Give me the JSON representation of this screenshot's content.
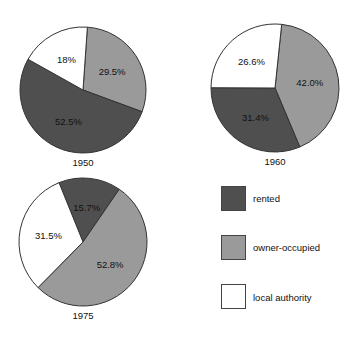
{
  "chart_data": {
    "type": "pie",
    "title": "",
    "categories": [
      "rented",
      "owner-occupied",
      "local authority"
    ],
    "colors": {
      "rented": "#4f4f4f",
      "owner-occupied": "#9a9a9a",
      "local authority": "#ffffff"
    },
    "pies": [
      {
        "label": "1950",
        "cx": 83,
        "cy": 90,
        "r": 63,
        "start_angle": 4,
        "order": [
          "owner-occupied",
          "rented",
          "local authority"
        ],
        "values": {
          "rented": 52.5,
          "owner-occupied": 29.5,
          "local authority": 18
        },
        "value_labels": {
          "rented": "52.5%",
          "owner-occupied": "29.5%",
          "local authority": "18%"
        }
      },
      {
        "label": "1960",
        "cx": 275,
        "cy": 88,
        "r": 64,
        "start_angle": 6,
        "order": [
          "owner-occupied",
          "rented",
          "local authority"
        ],
        "values": {
          "rented": 31.4,
          "owner-occupied": 42.0,
          "local authority": 26.6
        },
        "value_labels": {
          "rented": "31.4%",
          "owner-occupied": "42.0%",
          "local authority": "26.6%"
        }
      },
      {
        "label": "1975",
        "cx": 83,
        "cy": 242,
        "r": 64,
        "start_angle": -22,
        "order": [
          "rented",
          "owner-occupied",
          "local authority"
        ],
        "values": {
          "rented": 15.7,
          "owner-occupied": 52.8,
          "local authority": 31.5
        },
        "value_labels": {
          "rented": "15.7%",
          "owner-occupied": "52.8%",
          "local authority": "31.5%"
        }
      }
    ],
    "legend": [
      {
        "label": "rented",
        "color": "#4f4f4f"
      },
      {
        "label": "owner-occupied",
        "color": "#9a9a9a"
      },
      {
        "label": "local authority",
        "color": "#ffffff"
      }
    ],
    "legend_position": "bottom-right"
  },
  "legend": {
    "items": [
      {
        "label": "rented"
      },
      {
        "label": "owner-occupied"
      },
      {
        "label": "local authority"
      }
    ]
  }
}
